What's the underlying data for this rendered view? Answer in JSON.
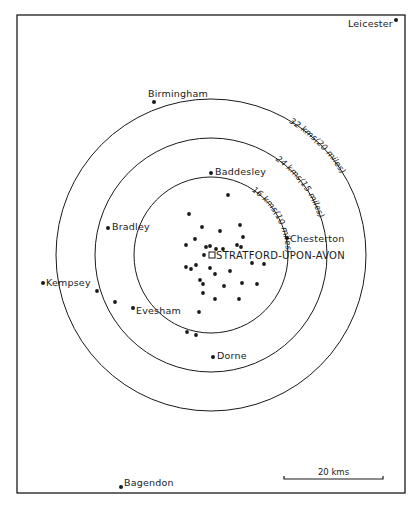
{
  "map": {
    "frame": {
      "x": 17,
      "y": 15,
      "width": 388,
      "height": 478
    },
    "center": {
      "name": "STRATFORD-UPON-AVON",
      "x": 212,
      "y": 255,
      "marker": "square"
    },
    "rings": [
      {
        "label": "16 kms(10 miles)",
        "rx": 77,
        "ry": 78,
        "cx": 211,
        "cy": 255,
        "text_path_start": "62%"
      },
      {
        "label": "24 kms(15 miles)",
        "rx": 116,
        "ry": 117,
        "cx": 211,
        "cy": 255,
        "text_path_start": "63%"
      },
      {
        "label": "32 kms(20 miles)",
        "rx": 155,
        "ry": 156,
        "cx": 211,
        "cy": 255,
        "text_path_start": "64%"
      }
    ],
    "places": [
      {
        "name": "Leicester",
        "x": 396,
        "y": 20,
        "label_x": 348,
        "label_y": 27,
        "anchor": "start"
      },
      {
        "name": "Birmingham",
        "x": 154,
        "y": 102,
        "label_x": 148,
        "label_y": 97,
        "anchor": "start"
      },
      {
        "name": "Baddesley",
        "x": 211,
        "y": 173,
        "label_x": 215,
        "label_y": 175,
        "anchor": "start"
      },
      {
        "name": "Bradley",
        "x": 108,
        "y": 228,
        "label_x": 112,
        "label_y": 230,
        "anchor": "start"
      },
      {
        "name": "Chesterton",
        "x": 287,
        "y": 238,
        "label_x": 290,
        "label_y": 242,
        "anchor": "start"
      },
      {
        "name": "Kempsey",
        "x": 43,
        "y": 283,
        "label_x": 46,
        "label_y": 286,
        "anchor": "start"
      },
      {
        "name": "Evesham",
        "x": 133,
        "y": 308,
        "label_x": 136,
        "label_y": 314,
        "anchor": "start"
      },
      {
        "name": "Dorne",
        "x": 213,
        "y": 357,
        "label_x": 217,
        "label_y": 359,
        "anchor": "start"
      },
      {
        "name": "Bagendon",
        "x": 121,
        "y": 487,
        "label_x": 124,
        "label_y": 486,
        "anchor": "start"
      }
    ],
    "sites": [
      [
        228,
        195
      ],
      [
        189,
        214
      ],
      [
        202,
        227
      ],
      [
        220,
        231
      ],
      [
        240,
        225
      ],
      [
        243,
        237
      ],
      [
        195,
        239
      ],
      [
        186,
        245
      ],
      [
        206,
        247
      ],
      [
        210,
        246
      ],
      [
        216,
        249
      ],
      [
        223,
        249
      ],
      [
        237,
        245
      ],
      [
        241,
        247
      ],
      [
        204,
        255
      ],
      [
        252,
        263
      ],
      [
        264,
        264
      ],
      [
        186,
        267
      ],
      [
        191,
        269
      ],
      [
        196,
        265
      ],
      [
        210,
        268
      ],
      [
        215,
        274
      ],
      [
        230,
        271
      ],
      [
        200,
        280
      ],
      [
        203,
        284
      ],
      [
        224,
        286
      ],
      [
        242,
        283
      ],
      [
        257,
        284
      ],
      [
        203,
        293
      ],
      [
        215,
        299
      ],
      [
        239,
        299
      ],
      [
        199,
        312
      ],
      [
        97,
        291
      ],
      [
        115,
        302
      ],
      [
        187,
        332
      ],
      [
        196,
        335
      ]
    ],
    "scale_bar": {
      "label": "20 kms",
      "x1": 284,
      "x2": 383,
      "y": 479
    },
    "colors": {
      "ink": "#1a1a1a",
      "paper": "#ffffff"
    }
  }
}
